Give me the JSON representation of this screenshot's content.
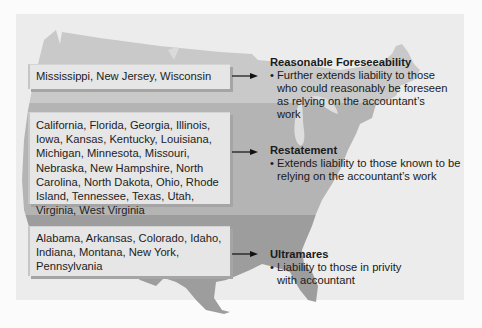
{
  "colors": {
    "page_bg": "#fbfbfb",
    "panel_bg": "#ececec",
    "band_top": "#c9c9c9",
    "band_mid": "#b4b4b4",
    "band_bottom": "#9d9d9d",
    "box_bg": "#e6e6e6",
    "text": "#222222"
  },
  "rows": [
    {
      "states": "Mississippi, New Jersey, Wisconsin",
      "rule_title": "Reasonable Foreseeability",
      "rule_desc": "Further extends liability to those who could reasonably be foreseen as relying on the accountant’s work"
    },
    {
      "states": "California, Florida, Georgia, Illinois, Iowa, Kansas, Kentucky, Louisiana, Michigan, Minnesota, Missouri, Nebraska, New Hampshire, North Carolina, North Dakota, Ohio, Rhode Island, Tennessee, Texas, Utah, Virginia, West Virginia",
      "rule_title": "Restatement",
      "rule_desc": "Extends liability to those known to be relying on the accountant’s work"
    },
    {
      "states": "Alabama, Arkansas, Colorado, Idaho, Indiana, Montana, New York, Pennsylvania",
      "rule_title": "Ultramares",
      "rule_desc": "Liability to those in privity with accountant"
    }
  ],
  "icons": {
    "arrow": "arrow-right-icon",
    "bullet": "•"
  }
}
